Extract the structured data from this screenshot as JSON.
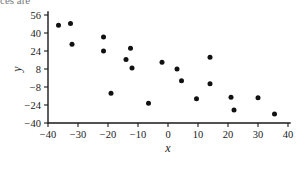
{
  "figure": {
    "top_cropped_text": "ces are",
    "background_color": "#ffffff",
    "marker_color": "#111111",
    "axis_color": "#1a1a1a"
  },
  "chart_data": {
    "type": "scatter",
    "title": "",
    "xlabel": "x",
    "ylabel": "y",
    "xlim": [
      -40,
      40
    ],
    "ylim": [
      -40,
      56
    ],
    "xticks": [
      -40,
      -30,
      -20,
      -10,
      0,
      10,
      20,
      30,
      40
    ],
    "xtick_labels": [
      "-40",
      "-30",
      "-20",
      "-10",
      "0",
      "10",
      "20",
      "30",
      "40"
    ],
    "yticks": [
      -40,
      -24,
      -8,
      8,
      24,
      40,
      56
    ],
    "ytick_labels": [
      "-40",
      "-24",
      "-8",
      "8",
      "24",
      "40",
      "56"
    ],
    "grid": false,
    "legend": false,
    "marker": "filled-circle",
    "marker_size": 5,
    "n_points": 20,
    "points": [
      {
        "x": -36.5,
        "y": 47.0
      },
      {
        "x": -32.5,
        "y": 48.5
      },
      {
        "x": -32.0,
        "y": 30.0
      },
      {
        "x": -21.5,
        "y": 36.5
      },
      {
        "x": -21.5,
        "y": 24.0
      },
      {
        "x": -19.0,
        "y": -13.5
      },
      {
        "x": -14.0,
        "y": 16.5
      },
      {
        "x": -12.5,
        "y": 26.5
      },
      {
        "x": -12.0,
        "y": 9.0
      },
      {
        "x": -6.5,
        "y": -22.5
      },
      {
        "x": -2.0,
        "y": 14.0
      },
      {
        "x": 3.0,
        "y": 8.0
      },
      {
        "x": 4.5,
        "y": -2.5
      },
      {
        "x": 9.5,
        "y": -18.5
      },
      {
        "x": 14.0,
        "y": 18.5
      },
      {
        "x": 14.0,
        "y": -5.0
      },
      {
        "x": 21.0,
        "y": -17.0
      },
      {
        "x": 22.0,
        "y": -28.5
      },
      {
        "x": 30.0,
        "y": -17.5
      },
      {
        "x": 35.5,
        "y": -32.0
      }
    ]
  }
}
